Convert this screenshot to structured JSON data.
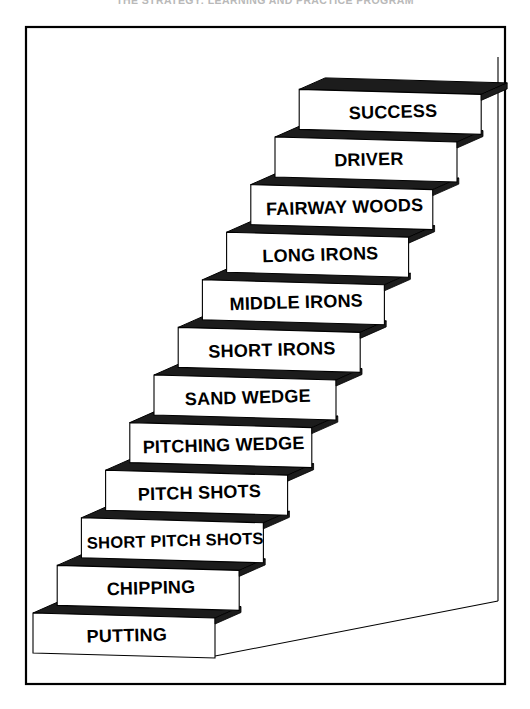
{
  "figure": {
    "caption": "THE STRATEGY: LEARNING AND PRACTICE PROGRAM",
    "frame": {
      "border_color": "#000000",
      "background_color": "#ffffff"
    },
    "colors": {
      "step_top": "#1c1c1c",
      "step_face": "#ffffff",
      "outline": "#000000",
      "text": "#000000"
    },
    "steps": [
      {
        "label": "SUCCESS",
        "level": 12
      },
      {
        "label": "DRIVER",
        "level": 11
      },
      {
        "label": "FAIRWAY WOODS",
        "level": 10
      },
      {
        "label": "LONG IRONS",
        "level": 9
      },
      {
        "label": "MIDDLE IRONS",
        "level": 8
      },
      {
        "label": "SHORT IRONS",
        "level": 7
      },
      {
        "label": "SAND WEDGE",
        "level": 6
      },
      {
        "label": "PITCHING WEDGE",
        "level": 5
      },
      {
        "label": "PITCH SHOTS",
        "level": 4
      },
      {
        "label": "SHORT PITCH SHOTS",
        "level": 3
      },
      {
        "label": "CHIPPING",
        "level": 2
      },
      {
        "label": "PUTTING",
        "level": 1
      }
    ]
  },
  "chart_data": {
    "type": "diagram",
    "subtype": "ascending-steps",
    "categories": [
      "PUTTING",
      "CHIPPING",
      "SHORT PITCH SHOTS",
      "PITCH SHOTS",
      "PITCHING WEDGE",
      "SAND WEDGE",
      "SHORT IRONS",
      "MIDDLE IRONS",
      "LONG IRONS",
      "FAIRWAY WOODS",
      "DRIVER",
      "SUCCESS"
    ],
    "values": [
      1,
      2,
      3,
      4,
      5,
      6,
      7,
      8,
      9,
      10,
      11,
      12
    ],
    "xlabel": "",
    "ylabel": "Progression",
    "legend": []
  }
}
